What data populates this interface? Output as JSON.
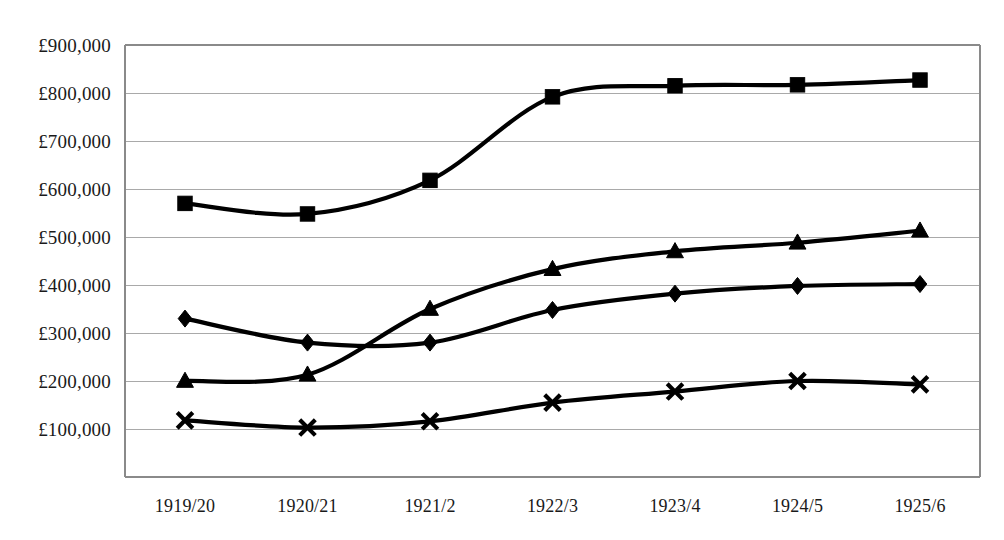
{
  "chart_data": {
    "type": "line",
    "title": "",
    "subtitle": "",
    "xlabel": "",
    "ylabel": "",
    "categories": [
      "1919/20",
      "1920/21",
      "1921/2",
      "1922/3",
      "1923/4",
      "1924/5",
      "1925/6"
    ],
    "ylim": [
      10000,
      900000
    ],
    "ytick_values": [
      900000,
      800000,
      700000,
      600000,
      500000,
      400000,
      300000,
      200000,
      100000
    ],
    "ytick_labels": [
      "£900,000",
      "£800,000",
      "£700,000",
      "£600,000",
      "£500,000",
      "£400,000",
      "£300,000",
      "£200,000",
      "£100,000"
    ],
    "grid": true,
    "legend": "none",
    "currency_symbol": "£",
    "series": [
      {
        "name": "series-square",
        "marker": "square",
        "color": "#000000",
        "values": [
          570000,
          548000,
          618000,
          792000,
          815000,
          817000,
          827000
        ]
      },
      {
        "name": "series-triangle",
        "marker": "triangle",
        "color": "#000000",
        "values": [
          200000,
          213000,
          350000,
          433000,
          470000,
          488000,
          513000
        ]
      },
      {
        "name": "series-diamond",
        "marker": "diamond",
        "color": "#000000",
        "values": [
          330000,
          280000,
          280000,
          348000,
          382000,
          398000,
          402000
        ]
      },
      {
        "name": "series-cross",
        "marker": "x",
        "color": "#000000",
        "values": [
          118000,
          103000,
          116000,
          155000,
          178000,
          200000,
          193000
        ]
      }
    ]
  },
  "plot": {
    "left": 125,
    "right": 980,
    "top": 45,
    "bottom": 477,
    "first_point_x": 185,
    "point_spacing": 122.5,
    "gridline_top_value": 900000,
    "gridline_step": 100000,
    "gridline_pixel_step": 48.0,
    "xtick_label_y": 512,
    "background_color": "#ffffff",
    "gridline_color": "#a9a9a9",
    "frame_color": "#8a8a8a",
    "line_color": "#000000"
  }
}
